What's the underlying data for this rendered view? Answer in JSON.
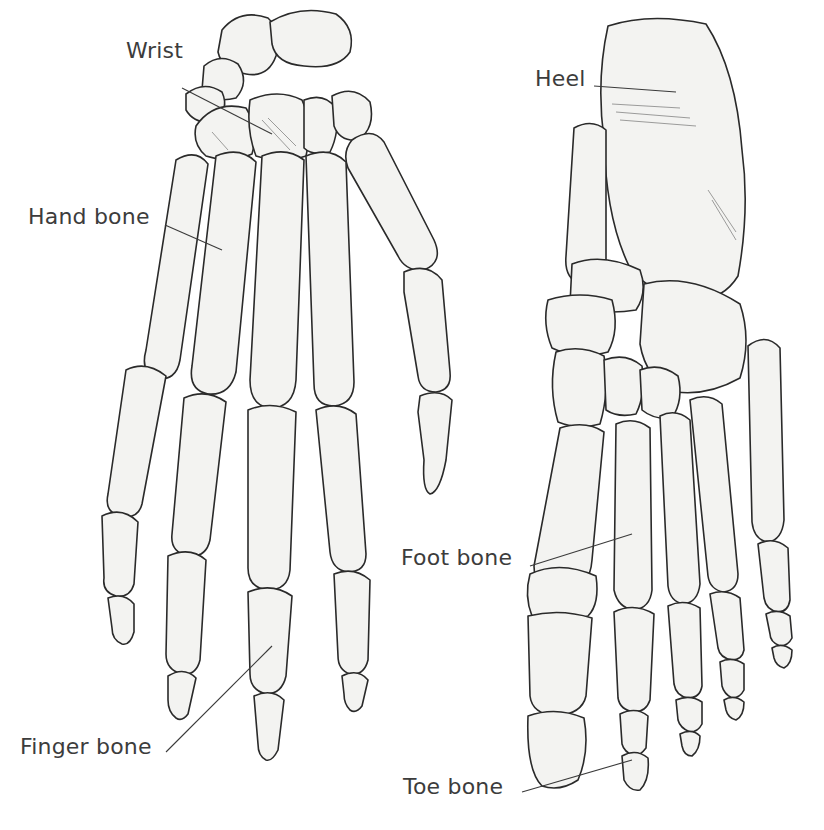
{
  "figure": {
    "colors": {
      "background": "#ffffff",
      "bone_fill": "#f3f3f1",
      "bone_outline": "#2a2a2a",
      "label_text": "#3c3c3c"
    }
  },
  "hand": {
    "labels": [
      {
        "id": "wrist",
        "text": "Wrist",
        "x": 126,
        "y": 38
      },
      {
        "id": "hand-bone",
        "text": "Hand bone",
        "x": 28,
        "y": 204
      },
      {
        "id": "finger-bone",
        "text": "Finger bone",
        "x": 20,
        "y": 734
      }
    ]
  },
  "foot": {
    "labels": [
      {
        "id": "heel",
        "text": "Heel",
        "x": 535,
        "y": 66
      },
      {
        "id": "foot-bone",
        "text": "Foot bone",
        "x": 401,
        "y": 545
      },
      {
        "id": "toe-bone",
        "text": "Toe bone",
        "x": 403,
        "y": 774
      }
    ]
  }
}
